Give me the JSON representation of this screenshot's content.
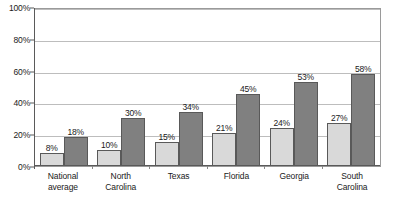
{
  "chart_data": {
    "type": "bar",
    "title": "",
    "subtitle": "",
    "xlabel": "",
    "ylabel": "",
    "ylim": [
      0,
      100
    ],
    "yticks": [
      "0%",
      "20%",
      "40%",
      "60%",
      "80%",
      "100%"
    ],
    "ytick_values": [
      0,
      20,
      40,
      60,
      80,
      100
    ],
    "grid": true,
    "legend": "none",
    "categories": [
      [
        "National",
        "average"
      ],
      [
        "North",
        "Carolina"
      ],
      [
        "Texas"
      ],
      [
        "Florida"
      ],
      [
        "Georgia"
      ],
      [
        "South",
        "Carolina"
      ]
    ],
    "series": [
      {
        "name": "series-1",
        "color": "#d9d9d9",
        "values": [
          8,
          10,
          15,
          21,
          24,
          27
        ],
        "labels": [
          "8%",
          "10%",
          "15%",
          "21%",
          "24%",
          "27%"
        ]
      },
      {
        "name": "series-2",
        "color": "#808080",
        "values": [
          18,
          30,
          34,
          45,
          53,
          58
        ],
        "labels": [
          "18%",
          "30%",
          "34%",
          "45%",
          "53%",
          "58%"
        ]
      }
    ],
    "colors": {
      "series_1": "#d9d9d9",
      "series_2": "#808080",
      "bar_border": "#595959",
      "gridline": "#bdbdbd",
      "axis": "#5a5a5a",
      "plot_border": "#9a9a9a",
      "background": "#ffffff",
      "text": "#1a1a1a"
    }
  }
}
